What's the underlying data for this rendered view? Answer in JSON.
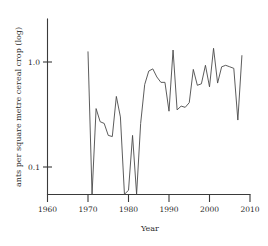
{
  "chart_data": {
    "type": "line",
    "title": "",
    "xlabel": "Year",
    "ylabel": "ants per square metre cereal crop (log)",
    "yscale": "log",
    "xlim": [
      1960,
      2010
    ],
    "ylim": [
      0.05,
      1.45
    ],
    "grid": false,
    "legend": null,
    "xticks": [
      1960,
      1970,
      1980,
      1990,
      2000,
      2010
    ],
    "xtick_labels": [
      "1960",
      "1970",
      "1980",
      "1990",
      "2000",
      "2010"
    ],
    "yticks": [
      0.1,
      1.0
    ],
    "ytick_labels": [
      "0.1",
      "1.0"
    ],
    "series": [
      {
        "name": "ants per square metre cereal crop",
        "color": "#4a4a4a",
        "x": [
          1970,
          1971,
          1972,
          1973,
          1974,
          1975,
          1976,
          1977,
          1978,
          1979,
          1980,
          1981,
          1982,
          1983,
          1984,
          1985,
          1986,
          1987,
          1988,
          1989,
          1990,
          1991,
          1992,
          1993,
          1994,
          1995,
          1996,
          1997,
          1998,
          1999,
          2000,
          2001,
          2002,
          2003,
          2004,
          2005,
          2006,
          2007,
          2008
        ],
        "y": [
          1.25,
          0.055,
          0.36,
          0.27,
          0.26,
          0.2,
          0.195,
          0.47,
          0.3,
          0.055,
          0.06,
          0.2,
          0.055,
          0.26,
          0.61,
          0.82,
          0.86,
          0.72,
          0.64,
          0.64,
          0.34,
          1.3,
          0.35,
          0.38,
          0.37,
          0.41,
          0.85,
          0.6,
          0.62,
          0.93,
          0.58,
          1.35,
          0.63,
          0.9,
          0.93,
          0.9,
          0.87,
          0.28,
          1.15
        ]
      }
    ]
  },
  "axes": {
    "xlabel": "Year",
    "ylabel": "ants per square metre cereal crop (log)",
    "xtick_labels": [
      "1960",
      "1970",
      "1980",
      "1990",
      "2000",
      "2010"
    ],
    "ytick_labels": [
      "1.0",
      "0.1"
    ]
  }
}
